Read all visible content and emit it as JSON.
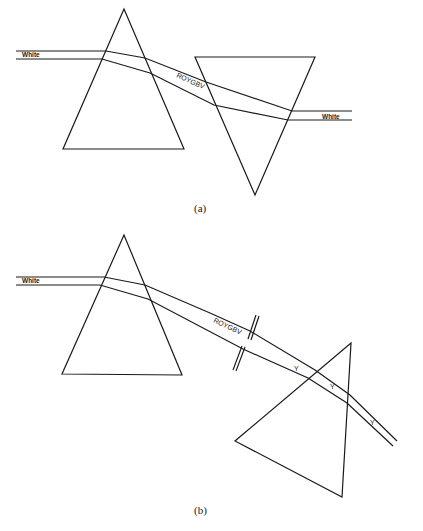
{
  "figure_a": {
    "caption": "(a)",
    "input_label": "White",
    "spectrum_label": "ROYGBV",
    "output_label": "White"
  },
  "figure_b": {
    "caption": "(b)",
    "input_label": "White",
    "spectrum_label": "ROYGBV",
    "filtered_labels": [
      "Y",
      "Y",
      "Y"
    ]
  }
}
